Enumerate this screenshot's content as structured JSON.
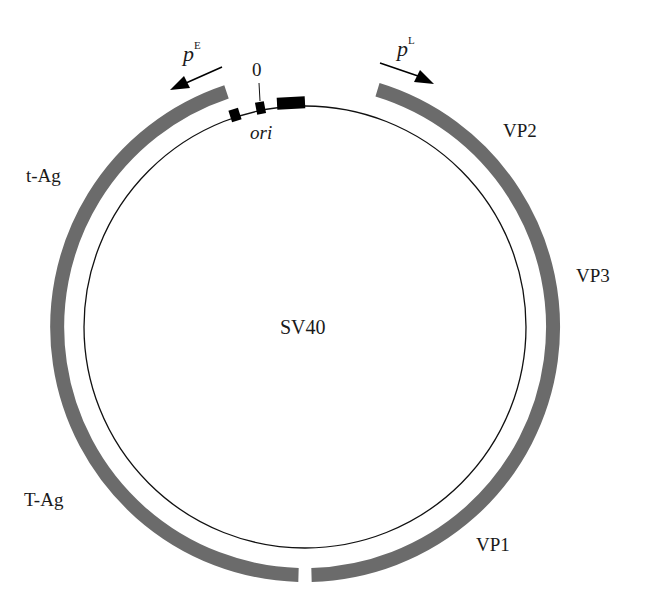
{
  "diagram": {
    "title": "SV40",
    "plasmid": {
      "cx": 305,
      "cy": 327,
      "r": 221,
      "band_r": 248,
      "band_width": 14,
      "band_color": "#6b6b6b"
    },
    "genes": [
      {
        "name": "early-region",
        "from_deg": 181.5,
        "to_deg": 341.5
      },
      {
        "name": "late-region",
        "from_deg": 17,
        "to_deg": 179
      }
    ],
    "labels": {
      "center": "SV40",
      "t_ag": "t-Ag",
      "T_ag": "T-Ag",
      "vp1": "VP1",
      "vp2": "VP2",
      "vp3": "VP3",
      "ori": "ori",
      "zero": "0",
      "pE_base": "p",
      "pE_sup": "E",
      "pL_base": "p",
      "pL_sup": "L"
    }
  }
}
